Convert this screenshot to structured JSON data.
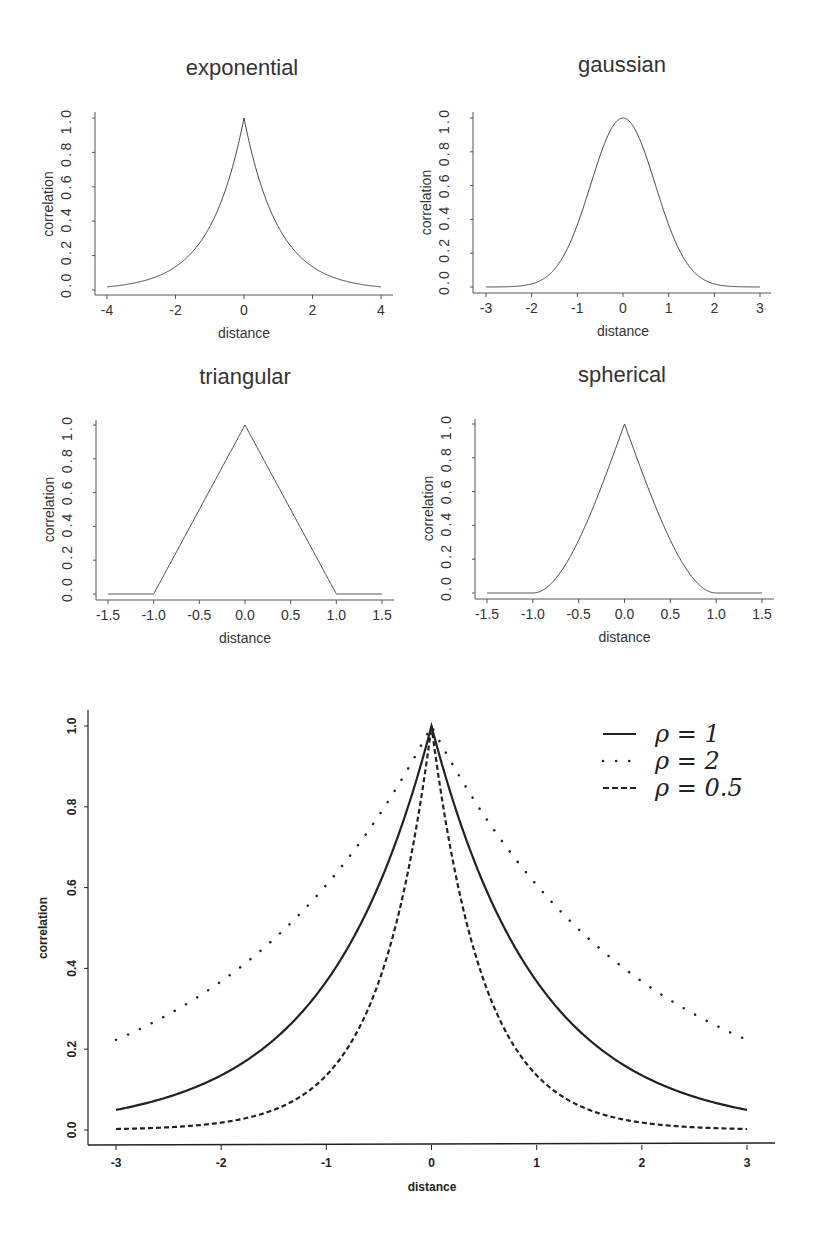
{
  "chart_data": [
    {
      "type": "line",
      "title": "exponential",
      "xlabel": "distance",
      "ylabel": "correlation",
      "xlim": [
        -4,
        4
      ],
      "ylim": [
        0,
        1
      ],
      "xticks": [
        "-4",
        "-2",
        "0",
        "2",
        "4"
      ],
      "yticks": [
        "0.0",
        "0.2",
        "0.4",
        "0.6",
        "0.8",
        "1.0"
      ],
      "function": "exp(-|d|)",
      "x": [
        -4,
        -3,
        -2,
        -1,
        0,
        1,
        2,
        3,
        4
      ],
      "values": [
        0.02,
        0.05,
        0.14,
        0.37,
        1.0,
        0.37,
        0.14,
        0.05,
        0.02
      ]
    },
    {
      "type": "line",
      "title": "gaussian",
      "xlabel": "distance",
      "ylabel": "correlation",
      "xlim": [
        -3,
        3
      ],
      "ylim": [
        0,
        1
      ],
      "xticks": [
        "-3",
        "-2",
        "-1",
        "0",
        "1",
        "2",
        "3"
      ],
      "yticks": [
        "0.0",
        "0.2",
        "0.4",
        "0.6",
        "0.8",
        "1.0"
      ],
      "function": "exp(-d^2)",
      "x": [
        -3,
        -2,
        -1,
        0,
        1,
        2,
        3
      ],
      "values": [
        0.0,
        0.02,
        0.37,
        1.0,
        0.37,
        0.02,
        0.0
      ]
    },
    {
      "type": "line",
      "title": "triangular",
      "xlabel": "distance",
      "ylabel": "correlation",
      "xlim": [
        -1.5,
        1.5
      ],
      "ylim": [
        0,
        1
      ],
      "xticks": [
        "-1.5",
        "-1.0",
        "-0.5",
        "0.0",
        "0.5",
        "1.0",
        "1.5"
      ],
      "yticks": [
        "0.0",
        "0.2",
        "0.4",
        "0.6",
        "0.8",
        "1.0"
      ],
      "function": "max(0, 1-|d|)",
      "x": [
        -1.5,
        -1.0,
        -0.5,
        0.0,
        0.5,
        1.0,
        1.5
      ],
      "values": [
        0.0,
        0.0,
        0.5,
        1.0,
        0.5,
        0.0,
        0.0
      ]
    },
    {
      "type": "line",
      "title": "spherical",
      "xlabel": "distance",
      "ylabel": "correlation",
      "xlim": [
        -1.5,
        1.5
      ],
      "ylim": [
        0,
        1
      ],
      "xticks": [
        "-1.5",
        "-1.0",
        "-0.5",
        "0.0",
        "0.5",
        "1.0",
        "1.5"
      ],
      "yticks": [
        "0.0",
        "0.2",
        "0.4",
        "0.6",
        "0.8",
        "1.0"
      ],
      "function": "1 - 1.5|d| + 0.5|d|^3 for |d|<1, else 0",
      "x": [
        -1.5,
        -1.0,
        -0.5,
        0.0,
        0.5,
        1.0,
        1.5
      ],
      "values": [
        0.0,
        0.0,
        0.3125,
        1.0,
        0.3125,
        0.0,
        0.0
      ]
    },
    {
      "type": "line",
      "title": "",
      "xlabel": "distance",
      "ylabel": "correlation",
      "xlim": [
        -3,
        3
      ],
      "ylim": [
        0,
        1
      ],
      "xticks": [
        "-3",
        "-2",
        "-1",
        "0",
        "1",
        "2",
        "3"
      ],
      "yticks": [
        "0.0",
        "0.2",
        "0.4",
        "0.6",
        "0.8",
        "1.0"
      ],
      "legend_position": "top-right",
      "x": [
        -3,
        -2,
        -1,
        0,
        1,
        2,
        3
      ],
      "series": [
        {
          "name": "ρ = 1",
          "style": "solid",
          "values": [
            0.05,
            0.14,
            0.37,
            1.0,
            0.37,
            0.14,
            0.05
          ]
        },
        {
          "name": "ρ = 2",
          "style": "dotted",
          "values": [
            0.22,
            0.37,
            0.61,
            1.0,
            0.61,
            0.37,
            0.22
          ]
        },
        {
          "name": "ρ = 0.5",
          "style": "dashed",
          "values": [
            0.0,
            0.02,
            0.14,
            1.0,
            0.14,
            0.02,
            0.0
          ]
        }
      ]
    }
  ],
  "panels": {
    "exponential": {
      "title": "exponential",
      "xlabel": "distance",
      "ylabel": "correlation"
    },
    "gaussian": {
      "title": "gaussian",
      "xlabel": "distance",
      "ylabel": "correlation"
    },
    "triangular": {
      "title": "triangular",
      "xlabel": "distance",
      "ylabel": "correlation"
    },
    "spherical": {
      "title": "spherical",
      "xlabel": "distance",
      "ylabel": "correlation"
    },
    "bottom": {
      "xlabel": "distance",
      "ylabel": "correlation"
    }
  },
  "legend": {
    "items": [
      {
        "label": "ρ = 1",
        "style": "solid"
      },
      {
        "label": "ρ = 2",
        "style": "dotted"
      },
      {
        "label": "ρ = 0.5",
        "style": "dashed"
      }
    ]
  },
  "colors": {
    "line": "#333333",
    "bottom_line": "#222222",
    "background": "#ffffff"
  }
}
